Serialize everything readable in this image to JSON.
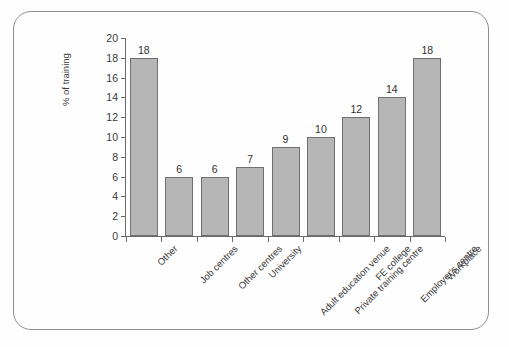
{
  "chart_data": {
    "type": "bar",
    "title": "",
    "subtitle": "",
    "xlabel": "",
    "ylabel": "% of training",
    "ylim": [
      0,
      20
    ],
    "ytick_step": 2,
    "yticks": [
      0,
      2,
      4,
      6,
      8,
      10,
      12,
      14,
      16,
      18,
      20
    ],
    "grid": false,
    "legend": null,
    "bar_fill_color": "#b6b6b6",
    "bar_border_color": "#6f6f6f",
    "axis_color": "#6b6b6b",
    "text_color": "#3a3a3a",
    "frame_color": "#8e8e8e",
    "background_color": "#fefefe",
    "show_value_labels": true,
    "category_label_rotation_deg": -45,
    "categories": [
      "Other",
      "Job centres",
      "Other centres",
      "University",
      "Adult education venue",
      "Private training centre",
      "FE college",
      "Employer's centre",
      "Workplace"
    ],
    "values": [
      18,
      6,
      6,
      7,
      9,
      10,
      12,
      14,
      18
    ],
    "value_labels": [
      "18",
      "6",
      "6",
      "7",
      "9",
      "10",
      "12",
      "14",
      "18"
    ],
    "ytick_labels": [
      "0",
      "2",
      "4",
      "6",
      "8",
      "10",
      "12",
      "14",
      "16",
      "18",
      "20"
    ]
  }
}
